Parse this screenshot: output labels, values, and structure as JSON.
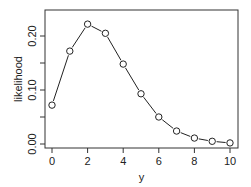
{
  "chart_data": {
    "type": "line",
    "title": "",
    "xlabel": "y",
    "ylabel": "likelihood",
    "x": [
      0,
      1,
      2,
      3,
      4,
      5,
      6,
      7,
      8,
      9,
      10
    ],
    "series": [
      {
        "name": "likelihood",
        "values": [
          0.072,
          0.172,
          0.222,
          0.205,
          0.148,
          0.093,
          0.05,
          0.024,
          0.011,
          0.005,
          0.002
        ],
        "marker": "open-circle",
        "line": "solid",
        "color": "#222222"
      }
    ],
    "xticks": [
      0,
      2,
      4,
      6,
      8,
      10
    ],
    "xtick_labels": [
      "0",
      "2",
      "4",
      "6",
      "8",
      "10"
    ],
    "yticks": [
      0.0,
      0.05,
      0.1,
      0.15,
      0.2
    ],
    "ytick_labels": [
      "0.00",
      "",
      "0.10",
      "",
      "0.20"
    ],
    "xlim": [
      -0.4,
      10.4
    ],
    "ylim": [
      -0.007,
      0.24
    ],
    "grid": false,
    "legend": "none"
  }
}
